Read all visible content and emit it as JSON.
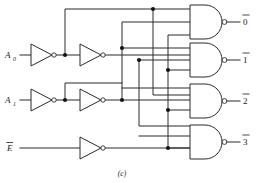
{
  "figure": {
    "caption": "(c)",
    "colors": {
      "wire": "#2b2b2b",
      "node": "#141414",
      "background": "#ffffff",
      "text": "#1a1a1a"
    }
  },
  "inputs": [
    {
      "id": "a0",
      "label": "A",
      "subscript": "0",
      "overbar": false,
      "y": 55
    },
    {
      "id": "a1",
      "label": "A",
      "subscript": "1",
      "overbar": false,
      "y": 100
    },
    {
      "id": "e",
      "label": "E",
      "subscript": "",
      "overbar": true,
      "y": 148
    }
  ],
  "outputs": [
    {
      "id": "o0",
      "label": "0",
      "overbar": true,
      "y": 22
    },
    {
      "id": "o1",
      "label": "1",
      "overbar": true,
      "y": 60
    },
    {
      "id": "o2",
      "label": "2",
      "overbar": true,
      "y": 101
    },
    {
      "id": "o3",
      "label": "3",
      "overbar": true,
      "y": 142
    }
  ],
  "gates": {
    "inverters": [
      {
        "id": "inv-a0-1",
        "name": "inverter-a0-stage1",
        "stage": 1,
        "input": "A0"
      },
      {
        "id": "inv-a0-2",
        "name": "inverter-a0-stage2",
        "stage": 2,
        "input": "A0-bar"
      },
      {
        "id": "inv-a1-1",
        "name": "inverter-a1-stage1",
        "stage": 1,
        "input": "A1"
      },
      {
        "id": "inv-a1-2",
        "name": "inverter-a1-stage2",
        "stage": 2,
        "input": "A1-bar"
      },
      {
        "id": "inv-e-1",
        "name": "inverter-enable",
        "stage": 1,
        "input": "E-bar"
      }
    ],
    "nands": [
      {
        "id": "nand0",
        "name": "nand-gate-output-0",
        "inputs": 3,
        "output": "0-bar"
      },
      {
        "id": "nand1",
        "name": "nand-gate-output-1",
        "inputs": 3,
        "output": "1-bar"
      },
      {
        "id": "nand2",
        "name": "nand-gate-output-2",
        "inputs": 3,
        "output": "2-bar"
      },
      {
        "id": "nand3",
        "name": "nand-gate-output-3",
        "inputs": 3,
        "output": "3-bar"
      }
    ]
  },
  "nodes": [
    {
      "id": "n1",
      "x": 65,
      "y": 55
    },
    {
      "id": "n2",
      "x": 65,
      "y": 100
    },
    {
      "id": "n3",
      "x": 122,
      "y": 48
    },
    {
      "id": "n4",
      "x": 122,
      "y": 100
    },
    {
      "id": "n5",
      "x": 139,
      "y": 60
    },
    {
      "id": "n6",
      "x": 153,
      "y": 9
    },
    {
      "id": "n7",
      "x": 168,
      "y": 70
    },
    {
      "id": "n8",
      "x": 168,
      "y": 110
    },
    {
      "id": "n9",
      "x": 168,
      "y": 148
    }
  ]
}
